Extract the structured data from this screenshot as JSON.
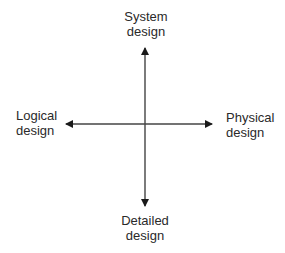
{
  "diagram": {
    "type": "quadrant-axes",
    "axes": {
      "top": {
        "line1": "System",
        "line2": "design"
      },
      "bottom": {
        "line1": "Detailed",
        "line2": "design"
      },
      "left": {
        "line1": "Logical",
        "line2": "design"
      },
      "right": {
        "line1": "Physical",
        "line2": "design"
      }
    },
    "colors": {
      "line": "#1a1a1a",
      "text": "#2a2a2a",
      "background": "#ffffff"
    }
  }
}
